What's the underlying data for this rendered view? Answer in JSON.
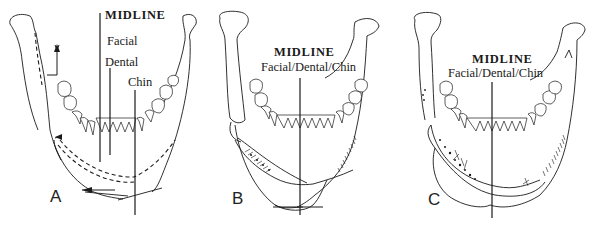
{
  "figure": {
    "panels": [
      {
        "id": "A",
        "letter": "A",
        "midline_label": "MIDLINE",
        "line_labels": [
          "Facial",
          "Dental",
          "Chin"
        ]
      },
      {
        "id": "B",
        "letter": "B",
        "midline_label": "MIDLINE",
        "combined_label": "Facial/Dental/Chin"
      },
      {
        "id": "C",
        "letter": "C",
        "midline_label": "MIDLINE",
        "combined_label": "Facial/Dental/Chin"
      }
    ],
    "colors": {
      "ink": "#1a1a1a",
      "background": "#ffffff"
    }
  }
}
